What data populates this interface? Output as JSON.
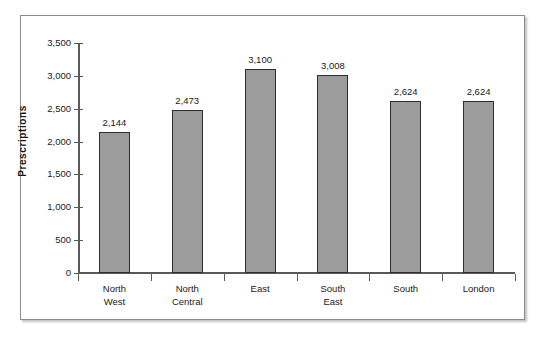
{
  "chart_data": {
    "type": "bar",
    "title": "",
    "xlabel": "",
    "ylabel": "Prescriptions",
    "categories": [
      "North West",
      "North Central",
      "East",
      "South East",
      "South",
      "London"
    ],
    "category_lines": [
      [
        "North",
        "West"
      ],
      [
        "North",
        "Central"
      ],
      [
        "East"
      ],
      [
        "South",
        "East"
      ],
      [
        "South"
      ],
      [
        "London"
      ]
    ],
    "values": [
      2144,
      2473,
      3100,
      3008,
      2624,
      2624
    ],
    "value_labels": [
      "2,144",
      "2,473",
      "3,100",
      "3,008",
      "2,624",
      "2,624"
    ],
    "ylim": [
      0,
      3500
    ],
    "ytick_values": [
      0,
      500,
      1000,
      1500,
      2000,
      2500,
      3000,
      3500
    ],
    "ytick_labels": [
      "0",
      "500",
      "1,000",
      "1,500",
      "2,000",
      "2,500",
      "3,000",
      "3,500"
    ],
    "grid": false,
    "legend": false,
    "bar_color": "#9c9c9c",
    "bar_border_color": "#2e2e2e",
    "axis_color": "#5a5a5a",
    "frame_color": "#8c8c8c",
    "background": "#ffffff"
  }
}
